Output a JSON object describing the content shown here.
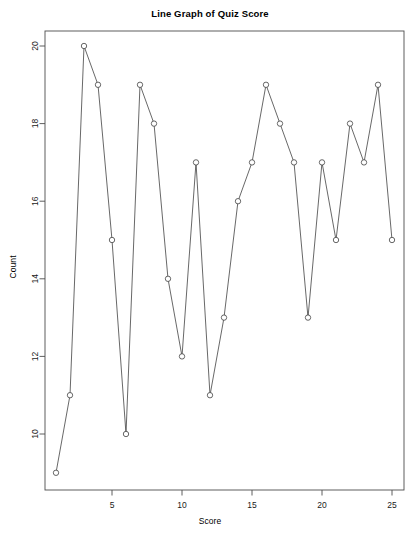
{
  "chart_data": {
    "type": "line",
    "title": "Line Graph of Quiz Score",
    "xlabel": "Score",
    "ylabel": "Count",
    "x": [
      1,
      2,
      3,
      4,
      5,
      6,
      7,
      8,
      9,
      10,
      11,
      12,
      13,
      14,
      15,
      16,
      17,
      18,
      19,
      20,
      21,
      22,
      23,
      24,
      25
    ],
    "values": [
      9,
      11,
      20,
      19,
      15,
      10,
      19,
      18,
      14,
      12,
      17,
      11,
      13,
      16,
      17,
      19,
      18,
      17,
      13,
      17,
      15,
      18,
      17,
      19,
      15
    ],
    "xlim": [
      1,
      25
    ],
    "ylim": [
      9,
      20
    ],
    "xticks": [
      5,
      10,
      15,
      20,
      25
    ],
    "yticks": [
      10,
      12,
      14,
      16,
      18,
      20
    ],
    "grid": false,
    "legend": false,
    "marker": "open-circle",
    "line_color": "#4d4d4d",
    "marker_color": "#4d4d4d",
    "axis_color": "#4d4d4d"
  }
}
